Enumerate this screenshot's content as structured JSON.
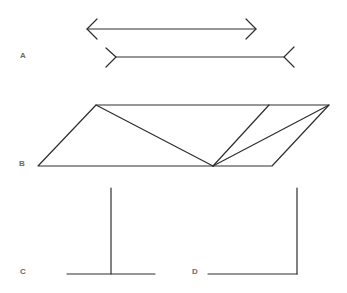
{
  "figure": {
    "type": "geometric-illusions",
    "line_color": "#2e2e2e",
    "label_color": "#6b6b6b",
    "panels": [
      {
        "label": "A",
        "name": "muller-lyer-illusion",
        "label_pos": [
          20,
          52
        ],
        "shapes": {
          "arrow_inward": {
            "x1": 87,
            "x2": 256,
            "y": 29,
            "fin": 10,
            "fin_spread": 10
          },
          "arrow_outward": {
            "x1": 106,
            "x2": 284,
            "y": 57,
            "fin": 10,
            "fin_spread": 10
          }
        }
      },
      {
        "label": "B",
        "name": "sander-parallelogram-illusion",
        "label_pos": [
          19,
          160
        ],
        "shapes": {
          "outer": [
            [
              96,
              105
            ],
            [
              329,
              105
            ],
            [
              272,
              166
            ],
            [
              38,
              166
            ]
          ],
          "divider_top": [
            269,
            105
          ],
          "divider_bottom": [
            213,
            166
          ]
        }
      },
      {
        "label": "C",
        "name": "vertical-horizontal-t-illusion",
        "label_pos": [
          20,
          268
        ],
        "shapes": {
          "vertical": {
            "x": 111,
            "y1": 188,
            "y2": 274
          },
          "horizontal": {
            "x1": 67,
            "x2": 155,
            "y": 274
          }
        }
      },
      {
        "label": "D",
        "name": "vertical-horizontal-l-illusion",
        "label_pos": [
          192,
          268
        ],
        "shapes": {
          "vertical": {
            "x": 297,
            "y1": 188,
            "y2": 274
          },
          "horizontal": {
            "x1": 208,
            "x2": 297,
            "y": 274
          }
        }
      }
    ]
  }
}
